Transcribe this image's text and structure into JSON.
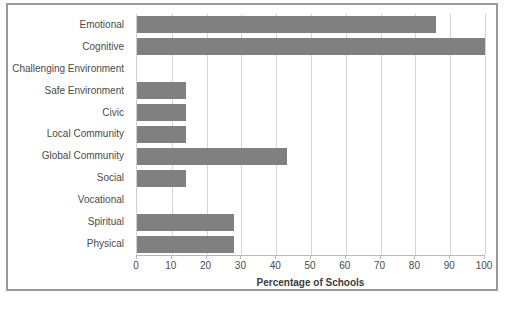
{
  "chart_data": {
    "type": "bar",
    "orientation": "horizontal",
    "title": "",
    "xlabel": "Percentage of Schools",
    "ylabel": "",
    "xlim": [
      0,
      100
    ],
    "xticks": [
      0,
      10,
      20,
      30,
      40,
      50,
      60,
      70,
      80,
      90,
      100
    ],
    "grid": true,
    "legend": false,
    "bar_color": "#808080",
    "categories": [
      "Emotional",
      "Cognitive",
      "Challenging Environment",
      "Safe Environment",
      "Civic",
      "Local Community",
      "Global Community",
      "Social",
      "Vocational",
      "Spiritual",
      "Physical"
    ],
    "values": [
      86,
      100,
      0,
      14,
      14,
      14,
      43,
      14,
      0,
      28,
      28
    ]
  },
  "figure": {
    "border_color": "#9a9a9a",
    "background": "#ffffff"
  }
}
